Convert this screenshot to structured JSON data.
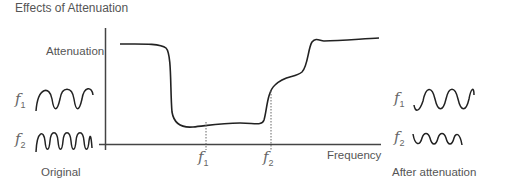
{
  "diagram": {
    "title": "Effects of Attenuation",
    "y_axis_label": "Attenuation",
    "x_axis_label": "Frequency",
    "markers": [
      {
        "symbol": "f",
        "subscript": "1"
      },
      {
        "symbol": "f",
        "subscript": "2"
      }
    ],
    "left_panel": {
      "caption": "Original",
      "waves": [
        {
          "symbol": "f",
          "subscript": "1",
          "description": "low frequency, full amplitude"
        },
        {
          "symbol": "f",
          "subscript": "2",
          "description": "higher frequency, full amplitude"
        }
      ]
    },
    "right_panel": {
      "caption": "After attenuation",
      "waves": [
        {
          "symbol": "f",
          "subscript": "1",
          "description": "low frequency, full amplitude (not attenuated)"
        },
        {
          "symbol": "f",
          "subscript": "2",
          "description": "higher frequency, reduced amplitude (attenuated)"
        }
      ]
    },
    "colors": {
      "line": "#222222",
      "axis": "#444444",
      "text": "#555555"
    }
  }
}
